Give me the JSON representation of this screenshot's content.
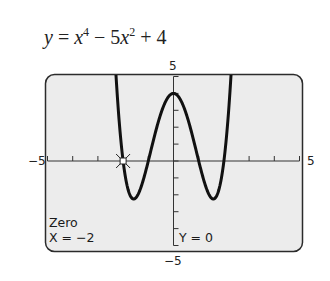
{
  "equation": {
    "lhs": "y",
    "eq": " = ",
    "t1_var": "x",
    "t1_exp": "4",
    "op1": " − 5",
    "t2_var": "x",
    "t2_exp": "2",
    "op2": " + 4"
  },
  "window": {
    "ymax_label": "5",
    "ymin_label": "−5",
    "xmin_label": "−5",
    "xmax_label": "5"
  },
  "screen": {
    "mode_label": "Zero",
    "x_readout": "X = −2",
    "y_readout": "Y = 0"
  },
  "colors": {
    "screen_bg": "#ececec",
    "frame": "#2b2b2b",
    "curve": "#111111"
  },
  "chart_data": {
    "type": "line",
    "xlabel": "",
    "ylabel": "",
    "xlim": [
      -5,
      5
    ],
    "ylim": [
      -5,
      5
    ],
    "xticks": [
      -5,
      -4,
      -3,
      -2,
      -1,
      0,
      1,
      2,
      3,
      4,
      5
    ],
    "yticks": [
      -5,
      -4,
      -3,
      -2,
      -1,
      0,
      1,
      2,
      3,
      4,
      5
    ],
    "grid": false,
    "series": [
      {
        "name": "y = x^4 − 5x^2 + 4",
        "x": [
          -2.4,
          -2.2,
          -2.0,
          -1.8,
          -1.58,
          -1.4,
          -1.2,
          -1.0,
          -0.6,
          -0.3,
          0,
          0.3,
          0.6,
          1.0,
          1.2,
          1.4,
          1.58,
          1.8,
          2.0,
          2.2,
          2.4
        ],
        "values": [
          8.38,
          3.23,
          0,
          -1.7,
          -2.25,
          -1.96,
          -1.13,
          0,
          2.33,
          3.56,
          4,
          3.56,
          2.33,
          0,
          -1.13,
          -1.96,
          -2.25,
          -1.7,
          0,
          3.23,
          8.38
        ]
      }
    ],
    "annotations": [
      {
        "text": "Zero",
        "position": "bottom-left"
      },
      {
        "text": "X = −2",
        "position": "bottom-left"
      },
      {
        "text": "Y = 0",
        "position": "bottom-center"
      },
      {
        "type": "cursor",
        "x": -2,
        "y": 0
      }
    ]
  }
}
